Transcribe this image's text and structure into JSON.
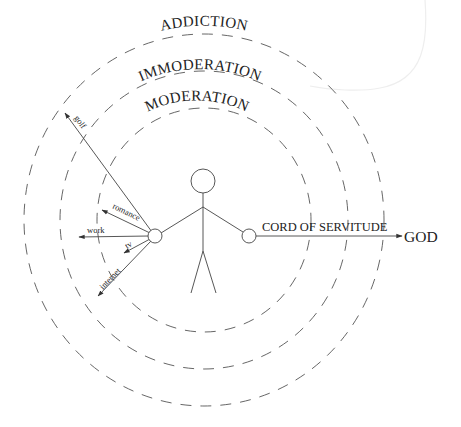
{
  "diagram": {
    "rings": [
      {
        "label": "MODERATION",
        "rx": 107,
        "ry": 112
      },
      {
        "label": "IMMODERATION",
        "rx": 144,
        "ry": 149
      },
      {
        "label": "ADDICTION",
        "rx": 180,
        "ry": 186
      }
    ],
    "center": {
      "x": 204,
      "y": 220
    },
    "pulls": [
      {
        "label": "golf"
      },
      {
        "label": "romance"
      },
      {
        "label": "work"
      },
      {
        "label": "tv"
      },
      {
        "label": "internet"
      }
    ],
    "cord": {
      "label": "CORD OF SERVITUDE",
      "target": "GOD"
    },
    "colors": {
      "stroke": "#444444",
      "ring": "#555555",
      "text": "#222222",
      "background": "#ffffff"
    }
  }
}
